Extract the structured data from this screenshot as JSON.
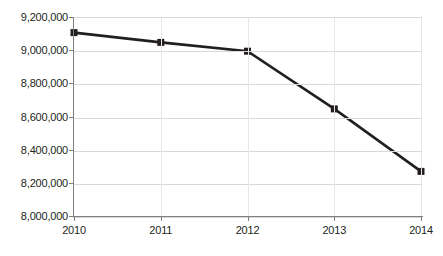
{
  "chart_data": {
    "type": "line",
    "title": "",
    "xlabel": "",
    "ylabel": "Estimated number of offenses",
    "categories": [
      "2010",
      "2011",
      "2012",
      "2013",
      "2014"
    ],
    "values": [
      9112000,
      9053000,
      9000000,
      8652000,
      8275000
    ],
    "series": [
      {
        "name": "Estimated number of offenses",
        "values": [
          9112000,
          9053000,
          9000000,
          8652000,
          8275000
        ]
      }
    ],
    "ylim": [
      8000000,
      9200000
    ],
    "ytick_values": [
      9200000,
      9000000,
      8800000,
      8600000,
      8400000,
      8200000,
      8000000
    ],
    "ytick_labels": [
      "9,200,000",
      "9,000,000",
      "8,800,000",
      "8,600,000",
      "8,400,000",
      "8,200,000",
      "8,000,000"
    ],
    "xtick_labels": [
      "2010",
      "2011",
      "2012",
      "2013",
      "2014"
    ],
    "grid": "horizontal",
    "legend": "none",
    "marker": "square",
    "line_color": "#231f20",
    "marker_color": "#231f20",
    "gridline_color": "#d9d9d9",
    "axis_color": "#808080",
    "background_color": "#ffffff"
  }
}
